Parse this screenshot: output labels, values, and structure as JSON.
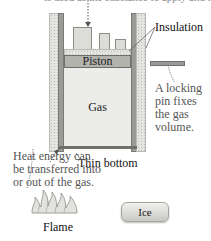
{
  "top_caption_partial": "is used as the substance to apply and load",
  "labels": {
    "insulation": "Insulation",
    "piston": "Piston",
    "gas": "Gas",
    "locking_pin": [
      "A locking",
      "pin fixes",
      "the gas",
      "volume."
    ],
    "thin_bottom": "Thin bottom",
    "heat_transfer": [
      "Heat energy can",
      "be transferred into",
      "or out of the gas."
    ],
    "flame": "Flame",
    "ice": "Ice"
  },
  "colors": {
    "wall": "#9a9a96",
    "insulation": "#e4e4e0",
    "piston": "#b3b3ae",
    "gas": "#ececea",
    "weight": "#dcdcd8"
  }
}
